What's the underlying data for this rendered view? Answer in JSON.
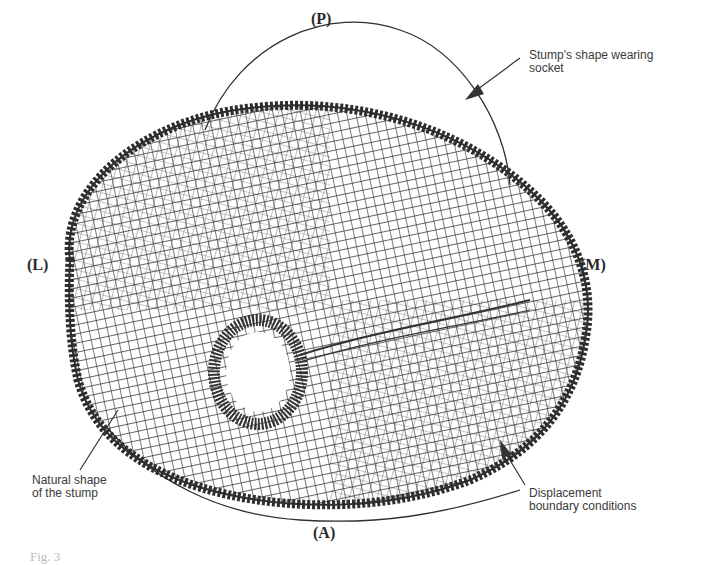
{
  "figure": {
    "labels": {
      "posterior": "(P)",
      "lateral": "(L)",
      "medial": "(M)",
      "anterior": "(A)"
    },
    "annotations": {
      "socket_shape": [
        "Stump's shape wearing",
        "socket"
      ],
      "natural_shape": [
        "Natural shape",
        "of the stump"
      ],
      "boundary_conditions": [
        "Displacement",
        "boundary conditions"
      ]
    },
    "caption": "Fig. 3",
    "colors": {
      "mesh": "#333333",
      "outline": "#2e2e2e",
      "background": "#ffffff"
    }
  }
}
